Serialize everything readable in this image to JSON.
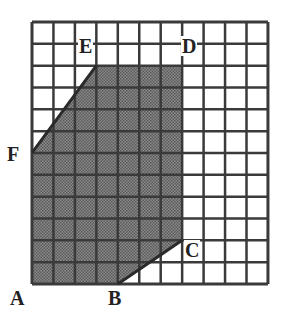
{
  "diagram": {
    "type": "grid-polygon",
    "grid": {
      "columns": 11,
      "rows": 12,
      "origin_px": [
        32,
        22
      ],
      "cell_w": 21.45,
      "cell_h": 21.83
    },
    "colors": {
      "grid_line": "#3a3a3a",
      "shade": "#7a7a7a",
      "shade_dot": "#5a5a5a",
      "background": "#ffffff"
    },
    "polygon": {
      "vertices": [
        {
          "name": "A",
          "col": 0,
          "row": 12
        },
        {
          "name": "B",
          "col": 4,
          "row": 12
        },
        {
          "name": "C",
          "col": 7,
          "row": 10
        },
        {
          "name": "D",
          "col": 7,
          "row": 2
        },
        {
          "name": "E",
          "col": 3,
          "row": 2
        },
        {
          "name": "F",
          "col": 0,
          "row": 6
        }
      ]
    },
    "labels": [
      {
        "id": "A",
        "text": "A",
        "x": 10,
        "y": 288
      },
      {
        "id": "B",
        "text": "B",
        "x": 108,
        "y": 288
      },
      {
        "id": "C",
        "text": "C",
        "x": 184,
        "y": 240
      },
      {
        "id": "D",
        "text": "D",
        "x": 181,
        "y": 36
      },
      {
        "id": "E",
        "text": "E",
        "x": 78,
        "y": 36
      },
      {
        "id": "F",
        "text": "F",
        "x": 7,
        "y": 144
      }
    ]
  }
}
